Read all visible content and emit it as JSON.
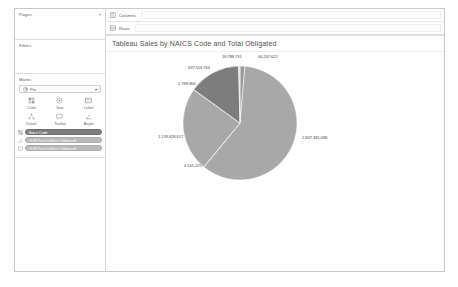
{
  "window": {
    "background": "#ffffff",
    "border_color": "#c9c9c9"
  },
  "sidebar": {
    "pages": {
      "label": "Pages",
      "caret": "▾"
    },
    "filters": {
      "label": "Filters"
    },
    "marks": {
      "label": "Marks",
      "type_selected": "Pie",
      "type_caret": "▾",
      "buttons": [
        {
          "label": "Color",
          "icon": "color-palette-icon",
          "glyph": "░"
        },
        {
          "label": "Size",
          "icon": "size-circle-icon",
          "glyph": "○"
        },
        {
          "label": "Label",
          "icon": "label-tag-icon",
          "glyph": "☷"
        },
        {
          "label": "Detail",
          "icon": "detail-hierarchy-icon",
          "glyph": "⑂"
        },
        {
          "label": "Tooltip",
          "icon": "tooltip-bubble-icon",
          "glyph": "⬜"
        },
        {
          "label": "Angle",
          "icon": "angle-icon",
          "glyph": "∡"
        }
      ],
      "pills": [
        {
          "label": "Naics Code",
          "kind": "dark",
          "icon": "color-field-icon",
          "icon_glyph": "░"
        },
        {
          "label": "SUM(Total Dollars Obligated)",
          "kind": "green",
          "icon": "angle-field-icon",
          "icon_glyph": "∡"
        },
        {
          "label": "SUM(Total Dollars Obligated)",
          "kind": "green",
          "icon": "label-field-icon",
          "icon_glyph": "□"
        }
      ]
    }
  },
  "shelves": {
    "columns": {
      "label": "Columns",
      "icon": "columns-icon",
      "glyph": "⌸"
    },
    "rows": {
      "label": "Rows",
      "icon": "rows-icon",
      "glyph": "☰"
    }
  },
  "viz": {
    "title": "Tableau Sales by NAICS Code and Total Obligated"
  },
  "chart_data": {
    "type": "pie",
    "title": "Tableau Sales by NAICS Code and Total Obligated",
    "measure": "SUM(Total Dollars Obligated)",
    "dimension": "Naics Code",
    "grid": false,
    "legend": "none",
    "labels_shown": true,
    "label_format": "thousands-separated integers",
    "slices": [
      {
        "label": "2,837,945,088",
        "value": 2837945088,
        "color": "#a8a8a8",
        "label_x": 196,
        "label_y": 83
      },
      {
        "label": "4,165,225",
        "value": 4165225,
        "color": "#a8a8a8",
        "label_x": 78,
        "label_y": 111
      },
      {
        "label": "1,139,628,617",
        "value": 1139628617,
        "color": "#a8a8a8",
        "label_x": 52,
        "label_y": 82
      },
      {
        "label": "2,799,966",
        "value": 2799966,
        "color": "#7d7d7d",
        "label_x": 72,
        "label_y": 29
      },
      {
        "label": "697,519,764",
        "value": 697519764,
        "color": "#7d7d7d",
        "label_x": 82,
        "label_y": 13
      },
      {
        "label": "18,789,731",
        "value": 18789731,
        "color": "#dcdcdc",
        "label_x": 116,
        "label_y": 2
      },
      {
        "label": "66,207,622",
        "value": 66207622,
        "color": "#9b9b9b",
        "label_x": 152,
        "label_y": 2
      }
    ],
    "colors": [
      "#a8a8a8",
      "#7d7d7d",
      "#dcdcdc",
      "#9b9b9b"
    ]
  }
}
